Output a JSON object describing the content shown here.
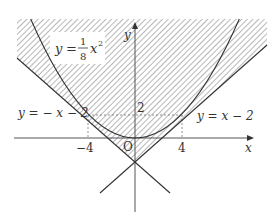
{
  "figure": {
    "curves": {
      "parabola": {
        "equation_label_y": "y",
        "equation_label_eq": "=",
        "frac_num": "1",
        "frac_den": "8",
        "equation_label_x": "x",
        "equation_label_exp": "2"
      },
      "line_left": {
        "label": "y = − x − 2"
      },
      "line_right": {
        "label": "y = x − 2"
      }
    },
    "axes": {
      "x_label": "x",
      "y_label": "y",
      "origin_label": "O",
      "x_ticks": [
        "−4",
        "4"
      ],
      "y_ticks": [
        "2"
      ]
    },
    "tangent_points": [
      [
        -4,
        2
      ],
      [
        4,
        2
      ]
    ],
    "colors": {
      "curve": "#333333",
      "axis": "#555555",
      "hatch": "#888888",
      "dashed": "#777777"
    }
  }
}
